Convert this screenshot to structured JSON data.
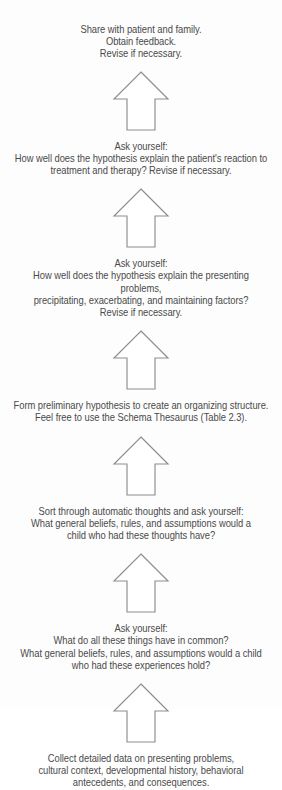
{
  "diagram": {
    "type": "vertical-flowchart",
    "direction": "bottom-to-top",
    "background_color": "#fdfdfd",
    "text_color": "#4a4a4a",
    "arrow_stroke_color": "#8d8d8d",
    "arrow_fill_color": "#ffffff",
    "step_count": 7,
    "arrow_count": 6
  },
  "steps": [
    {
      "id": "step-7-share",
      "text": "Share with patient and family.\nObtain feedback.\nRevise if necessary."
    },
    {
      "id": "step-6-evaluate-reaction",
      "text": "Ask yourself:\nHow well does the hypothesis explain the patient's reaction to\ntreatment and therapy? Revise if necessary."
    },
    {
      "id": "step-5-evaluate-presenting-problems",
      "text": "Ask yourself:\nHow well does the hypothesis explain the presenting problems,\nprecipitating, exacerbating, and maintaining factors?\nRevise if necessary."
    },
    {
      "id": "step-4-form-hypothesis",
      "text": "Form preliminary hypothesis to create an organizing structure.\nFeel free to use the Schema Thesaurus (Table 2.3)."
    },
    {
      "id": "step-3-sort-automatic-thoughts",
      "text": "Sort through automatic thoughts and ask yourself:\nWhat general beliefs, rules, and assumptions would a\nchild who had these thoughts have?"
    },
    {
      "id": "step-2-find-common-themes",
      "text": "Ask yourself:\nWhat do all these things have in common?\nWhat general beliefs, rules, and assumptions would a child\nwho had these experiences hold?"
    },
    {
      "id": "step-1-collect-data",
      "text": "Collect detailed data on presenting problems,\ncultural context, developmental history, behavioral\nantecedents, and consequences."
    }
  ],
  "arrows": [
    {
      "id": "arrow-6",
      "direction": "up"
    },
    {
      "id": "arrow-5",
      "direction": "up"
    },
    {
      "id": "arrow-4",
      "direction": "up"
    },
    {
      "id": "arrow-3",
      "direction": "up"
    },
    {
      "id": "arrow-2",
      "direction": "up"
    },
    {
      "id": "arrow-1",
      "direction": "up"
    }
  ]
}
